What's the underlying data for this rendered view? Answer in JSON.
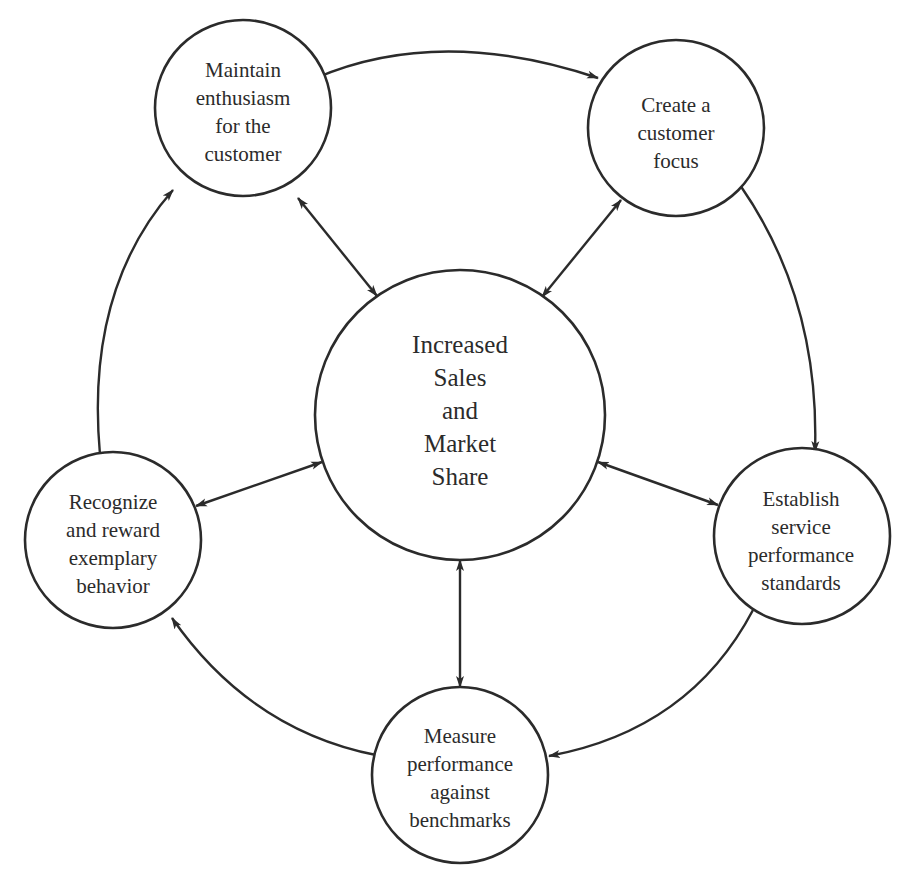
{
  "diagram": {
    "type": "cycle-hub",
    "stroke_color": "#2b2b2b",
    "center": {
      "id": "center",
      "lines": [
        "Increased",
        "Sales",
        "and",
        "Market",
        "Share"
      ],
      "cx": 460,
      "cy": 415,
      "r": 145
    },
    "nodes": [
      {
        "id": "maintain",
        "lines": [
          "Maintain",
          "enthusiasm",
          "for the",
          "customer"
        ],
        "cx": 243,
        "cy": 108,
        "r": 88
      },
      {
        "id": "create",
        "lines": [
          "Create a",
          "customer",
          "focus"
        ],
        "cx": 676,
        "cy": 128,
        "r": 88
      },
      {
        "id": "establish",
        "lines": [
          "Establish",
          "service",
          "performance",
          "standards"
        ],
        "cx": 802,
        "cy": 536,
        "r": 88
      },
      {
        "id": "measure",
        "lines": [
          "Measure",
          "performance",
          "against",
          "benchmarks"
        ],
        "cx": 460,
        "cy": 775,
        "r": 88
      },
      {
        "id": "recognize",
        "lines": [
          "Recognize",
          "and reward",
          "exemplary",
          "behavior"
        ],
        "cx": 113,
        "cy": 540,
        "r": 88
      }
    ],
    "cycle_edges": [
      {
        "from": "maintain",
        "to": "create"
      },
      {
        "from": "create",
        "to": "establish"
      },
      {
        "from": "establish",
        "to": "measure"
      },
      {
        "from": "measure",
        "to": "recognize"
      },
      {
        "from": "recognize",
        "to": "maintain"
      }
    ],
    "hub_edges": [
      {
        "between": [
          "center",
          "maintain"
        ],
        "direction": "both"
      },
      {
        "between": [
          "center",
          "create"
        ],
        "direction": "both"
      },
      {
        "between": [
          "center",
          "establish"
        ],
        "direction": "both"
      },
      {
        "between": [
          "center",
          "measure"
        ],
        "direction": "both"
      },
      {
        "between": [
          "center",
          "recognize"
        ],
        "direction": "both"
      }
    ]
  }
}
